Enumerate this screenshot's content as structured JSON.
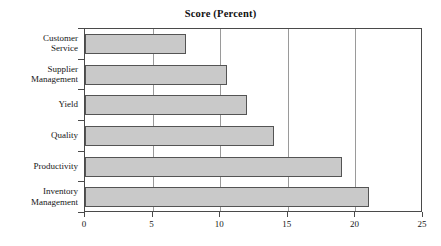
{
  "chart_data": {
    "type": "bar",
    "orientation": "horizontal",
    "title": "Score (Percent)",
    "xlabel": "",
    "ylabel": "",
    "categories": [
      "Customer Service",
      "Supplier Management",
      "Yield",
      "Quality",
      "Productivity",
      "Inventory Management"
    ],
    "category_lines": [
      [
        "Customer",
        "Service"
      ],
      [
        "Supplier",
        "Management"
      ],
      [
        "Yield"
      ],
      [
        "Quality"
      ],
      [
        "Productivity"
      ],
      [
        "Inventory",
        "Management"
      ]
    ],
    "values": [
      7.5,
      10.5,
      12,
      14,
      19,
      21
    ],
    "xlim": [
      0,
      25
    ],
    "xticks": [
      0,
      5,
      10,
      15,
      20,
      25
    ],
    "xtick_labels": [
      "0",
      "5",
      "10",
      "15",
      "20",
      "25"
    ],
    "grid": "vertical",
    "legend": "none",
    "bar_fill_color": "#c9c9c9",
    "bar_border_color": "#545454",
    "gridline_color": "#9a9a9a",
    "axis_color": "#4a4a4a",
    "background_color": "#ffffff"
  }
}
